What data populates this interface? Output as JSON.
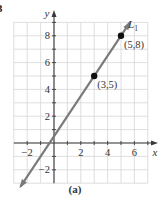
{
  "chart_data": {
    "type": "line",
    "title": "",
    "caption": "(a)",
    "corner_label": "3",
    "xlabel": "x",
    "ylabel": "y",
    "xlim": [
      -3,
      7
    ],
    "ylim": [
      -3,
      9
    ],
    "grid": true,
    "x_tick_labels": [
      {
        "value": -2,
        "label": "−2"
      },
      {
        "value": 2,
        "label": "2"
      },
      {
        "value": 4,
        "label": "4"
      },
      {
        "value": 6,
        "label": "6"
      }
    ],
    "y_tick_labels": [
      {
        "value": -2,
        "label": "−2"
      },
      {
        "value": 2,
        "label": "2"
      },
      {
        "value": 4,
        "label": "4"
      },
      {
        "value": 6,
        "label": "6"
      },
      {
        "value": 8,
        "label": "8"
      }
    ],
    "series": [
      {
        "name": "L1",
        "label_main": "L",
        "label_sub": "1",
        "equation": "y = 1.5x + 0.5",
        "x_range": [
          -2.5,
          5.65
        ],
        "color": "#7a7a7a"
      }
    ],
    "points": [
      {
        "x": 3,
        "y": 5,
        "label": "(3, 5)"
      },
      {
        "x": 5,
        "y": 8,
        "label": "(5, 8)"
      }
    ]
  },
  "colors": {
    "grid": "#d6d6d6",
    "axis": "#3a3a3a",
    "line": "#7a7a7a",
    "point": "#111111",
    "text": "#333333"
  }
}
